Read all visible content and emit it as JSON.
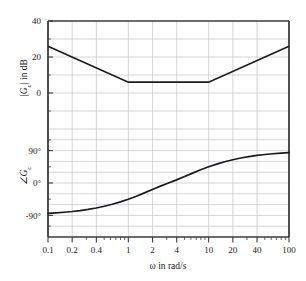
{
  "figure": {
    "background_color": "#ffffff",
    "axis_color": "#3b3b3b",
    "curve_color": "#1a1a1a",
    "grid_color": "#b9b9c4"
  },
  "chart_data": {
    "type": "line",
    "title": "",
    "subtitle": "",
    "xlabel": "ω in rad/s",
    "xscale": "log",
    "xlim": [
      0.1,
      100
    ],
    "grid": true,
    "legend": "none",
    "xticks": [
      0.1,
      0.2,
      0.4,
      1,
      2,
      4,
      10,
      20,
      40,
      100
    ],
    "xticklabels": [
      "0.1",
      "0.2",
      "0.4",
      "1",
      "2",
      "4",
      "10",
      "20",
      "40",
      "100"
    ],
    "panels": [
      {
        "name": "magnitude",
        "ylabel": "|G_c| in dB",
        "ylabel_display": "|G",
        "ylabel_sub": "c",
        "ylabel_tail": "| in dB",
        "ylim": [
          -20,
          40
        ],
        "yticks": [
          40,
          20,
          0
        ],
        "yticklabels": [
          "40",
          "20",
          "0"
        ],
        "series": [
          {
            "name": "magnitude-asymptote",
            "x": [
              0.1,
              1,
              10,
              100
            ],
            "values": [
              26,
              6,
              6,
              26
            ]
          }
        ]
      },
      {
        "name": "phase",
        "ylabel": "∠G_c",
        "ylabel_display": "∠G",
        "ylabel_sub": "c",
        "ylabel_tail": "",
        "ylim": [
          -150,
          150
        ],
        "yticks": [
          90,
          0,
          -90
        ],
        "yticklabels": [
          "90°",
          "0°",
          "-90°"
        ],
        "series": [
          {
            "name": "phase-curve",
            "x": [
              0.1,
              0.126,
              0.158,
              0.2,
              0.251,
              0.316,
              0.398,
              0.501,
              0.631,
              0.794,
              1.0,
              1.259,
              1.585,
              1.995,
              2.512,
              3.162,
              3.981,
              5.012,
              6.31,
              7.943,
              10.0,
              12.59,
              15.85,
              19.95,
              25.12,
              31.62,
              39.81,
              50.12,
              63.1,
              79.43,
              100.0
            ],
            "values": [
              -84.3,
              -82.9,
              -81.2,
              -79.1,
              -76.5,
              -73.3,
              -69.4,
              -64.7,
              -59.1,
              -52.5,
              -45.0,
              -36.6,
              -27.5,
              -18.0,
              -8.6,
              0.0,
              8.6,
              18.0,
              27.5,
              36.6,
              45.0,
              52.5,
              59.1,
              64.7,
              69.4,
              73.3,
              76.5,
              79.1,
              81.2,
              82.9,
              84.3
            ]
          }
        ]
      }
    ]
  }
}
